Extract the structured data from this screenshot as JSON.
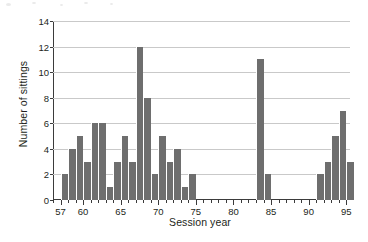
{
  "chart_data": {
    "type": "bar",
    "title": "",
    "xlabel": "Session year",
    "ylabel": "Number of sittings",
    "xlim": [
      56,
      95.5
    ],
    "ylim": [
      0,
      14
    ],
    "grid": true,
    "legend": null,
    "bar_color": "#6e6e6e",
    "y_ticks": [
      0,
      2,
      4,
      6,
      8,
      10,
      12,
      14
    ],
    "x_ticks_major": [
      57,
      60,
      65,
      70,
      75,
      80,
      85,
      90,
      95
    ],
    "x_tick_labels": [
      "57",
      "60",
      "65",
      "70",
      "75",
      "80",
      "85",
      "90",
      "95"
    ],
    "x_minor_tick_step": 1,
    "categories": [
      57,
      58,
      59,
      60,
      61,
      62,
      63,
      64,
      65,
      66,
      67,
      68,
      69,
      70,
      71,
      72,
      73,
      74,
      75,
      76,
      77,
      78,
      79,
      80,
      81,
      82,
      83,
      84,
      85,
      86,
      87,
      88,
      89,
      90,
      91,
      92,
      93,
      94,
      95
    ],
    "values": [
      2,
      4,
      5,
      3,
      6,
      6,
      1,
      3,
      5,
      3,
      12,
      8,
      2,
      5,
      3,
      4,
      1,
      2,
      0,
      0,
      0,
      0,
      0,
      0,
      0,
      0,
      11,
      2,
      0,
      0,
      0,
      0,
      0,
      0,
      2,
      3,
      5,
      7,
      3
    ]
  },
  "axes": {
    "y_title": "Number of sittings",
    "x_title": "Session year"
  }
}
